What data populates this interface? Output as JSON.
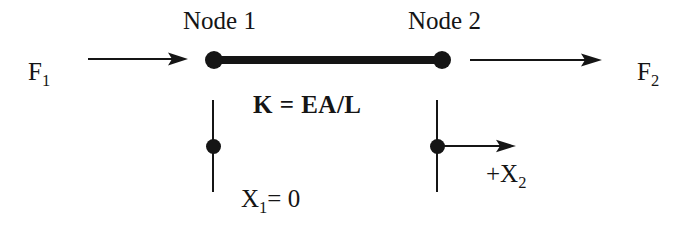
{
  "diagram": {
    "background_color": "#ffffff",
    "ink_color": "#151515",
    "labels": {
      "node1": "Node 1",
      "node2": "Node 2",
      "force_left_base": "F",
      "force_left_sub": "1",
      "force_right_base": "F",
      "force_right_sub": "2",
      "stiffness": "K = EA/L",
      "displacement_left_base": "X",
      "displacement_left_sub": "1",
      "displacement_left_value": "= 0",
      "displacement_right_base": "+X",
      "displacement_right_sub": "2"
    },
    "elements": {
      "bar_label": "bar-element",
      "node1_marker_label": "node-1-marker",
      "node2_marker_label": "node-2-marker",
      "support_left_label": "support-line-node-1",
      "support_right_label": "support-line-node-2",
      "force_arrow_left_label": "force-arrow-f1",
      "force_arrow_right_label": "force-arrow-f2",
      "displacement_arrow_label": "displacement-arrow-x2"
    }
  }
}
